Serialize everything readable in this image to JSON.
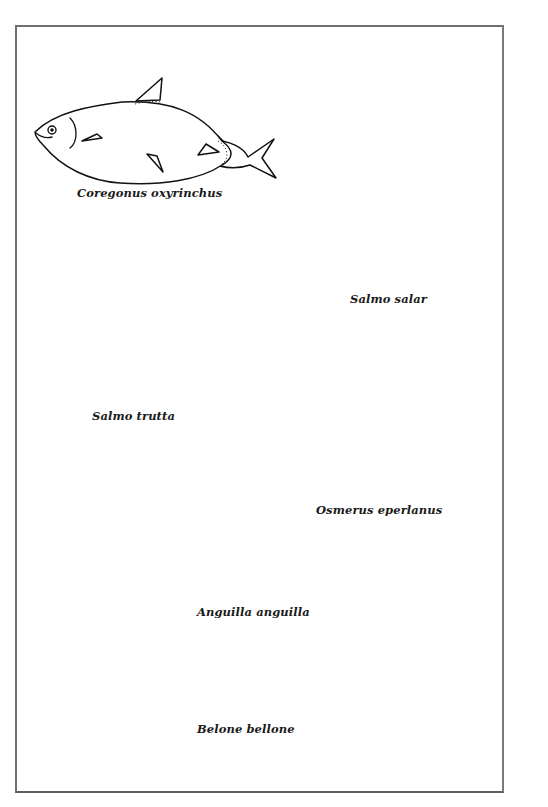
{
  "plate": {
    "figure_type": "fish identification plate",
    "species": [
      {
        "id": "coregonus",
        "label": "Coregonus oxyrinchus"
      },
      {
        "id": "salmo-salar",
        "label": "Salmo salar"
      },
      {
        "id": "salmo-trutta",
        "label": "Salmo trutta"
      },
      {
        "id": "osmerus",
        "label": "Osmerus eperlanus"
      },
      {
        "id": "anguilla",
        "label": "Anguilla anguilla"
      },
      {
        "id": "belone",
        "label": "Belone bellone"
      }
    ]
  },
  "colors": {
    "background": "#ffffff",
    "frame_border": "#6f6f6f",
    "ink": "#111111"
  }
}
